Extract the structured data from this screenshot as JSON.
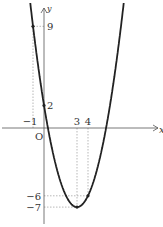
{
  "chart_data": {
    "type": "line",
    "title": "",
    "function": "y = x^2 - 6x + 2",
    "xlabel": "x",
    "ylabel": "y",
    "origin_label": "O",
    "x_ticks": [
      "-1",
      "3",
      "4"
    ],
    "y_ticks": [
      "9",
      "2",
      "-6",
      "-7"
    ],
    "marked_points": [
      {
        "x": -1,
        "y": 9
      },
      {
        "x": 0,
        "y": 2
      },
      {
        "x": 3,
        "y": -7
      },
      {
        "x": 4,
        "y": -6
      }
    ],
    "vertex": {
      "x": 3,
      "y": -7
    },
    "xlim": [
      -1.5,
      9.5
    ],
    "ylim": [
      -8.5,
      10.5
    ],
    "grid": false,
    "dashed_guides": true
  }
}
